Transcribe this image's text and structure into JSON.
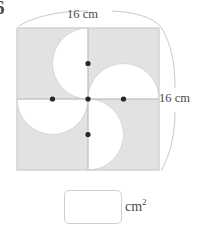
{
  "worksheet": {
    "question_number": "6",
    "top_dimension_label": "16 cm",
    "right_dimension_label": "16 cm",
    "answer_unit_text": "cm",
    "answer_unit_exponent": "2",
    "answer_value": ""
  },
  "colors": {
    "shaded_fill": "#e2e2e2",
    "shaded_stroke": "#d2d2d2",
    "white_fill": "#ffffff",
    "dot_color": "#262626",
    "divider_line": "#b9b9b9",
    "brace_line": "#c9c9c9",
    "box_border": "#cfcfcf",
    "text_color": "#4a4a4a"
  },
  "figure": {
    "type": "pinwheel-semicircles-in-square",
    "square": {
      "x": 17,
      "y": 28,
      "size": 142
    },
    "side_length_cm": 16,
    "half": 71,
    "quarter": 35.5,
    "center": {
      "x": 88,
      "y": 99
    },
    "dots": [
      {
        "name": "center-dot",
        "x": 88,
        "y": 99
      },
      {
        "name": "top-midpoint-dot",
        "x": 88,
        "y": 63.5
      },
      {
        "name": "left-midpoint-dot",
        "x": 52.5,
        "y": 99
      },
      {
        "name": "right-midpoint-dot",
        "x": 123.5,
        "y": 99
      },
      {
        "name": "bottom-midpoint-dot",
        "x": 88,
        "y": 134.5
      }
    ],
    "semicircles": [
      {
        "name": "top-left-semicircle",
        "center_x": 88,
        "center_y": 63.5,
        "radius": 35.5
      },
      {
        "name": "top-right-semicircle",
        "center_x": 123.5,
        "center_y": 99,
        "radius": 35.5
      },
      {
        "name": "bottom-right-semicircle",
        "center_x": 88,
        "center_y": 134.5,
        "radius": 35.5
      },
      {
        "name": "bottom-left-semicircle",
        "center_x": 52.5,
        "center_y": 99,
        "radius": 35.5
      }
    ]
  }
}
